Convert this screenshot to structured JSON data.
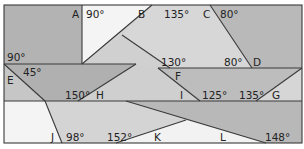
{
  "colors": {
    "background": "#ffffff",
    "dark_region": "#b3b3b3",
    "mid_region": "#c9c9c9",
    "light_region": "#dcdcdc",
    "white_region": "#f4f4f4",
    "line": "#3a3a3a",
    "text": "#222222"
  },
  "labels": {
    "A": "A",
    "B": "B",
    "C": "C",
    "D": "D",
    "E": "E",
    "F": "F",
    "G": "G",
    "H": "H",
    "I": "I",
    "J": "J",
    "K": "K",
    "L": "L"
  },
  "angles": {
    "a_90": "90°",
    "b_135": "135°",
    "c_80": "80°",
    "left_90": "90°",
    "e_45": "45°",
    "f_130": "130°",
    "d_80": "80°",
    "h_150": "150°",
    "i_125": "125°",
    "g_135": "135°",
    "j_98": "98°",
    "k_152": "152°",
    "l_148": "148°"
  }
}
